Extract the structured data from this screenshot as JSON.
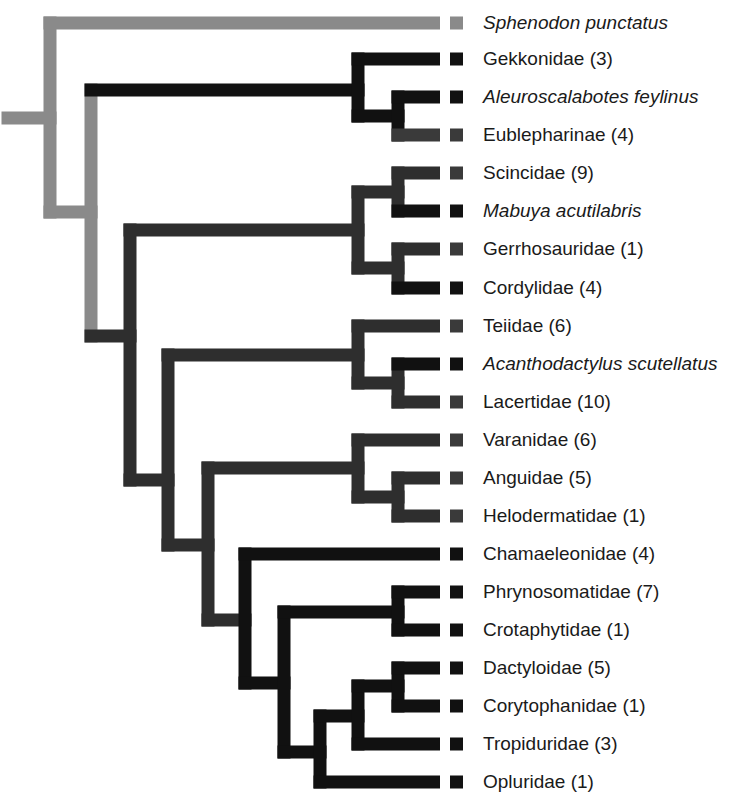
{
  "colors": {
    "outgroup": "#8a8a8a",
    "gekkota": "#111111",
    "squamata_dark": "#2e2e2e",
    "tip_black": "#111111",
    "tip_dark": "#3a3a3a",
    "tip_gray": "#8a8a8a",
    "background": "#ffffff"
  },
  "tips": [
    {
      "label": "Sphenodon punctatus",
      "italic": true,
      "y": 23,
      "color": "#8a8a8a"
    },
    {
      "label": "Gekkonidae (3)",
      "italic": false,
      "y": 59,
      "color": "#111111"
    },
    {
      "label": "Aleuroscalabotes feylinus",
      "italic": true,
      "y": 97,
      "color": "#111111"
    },
    {
      "label": "Eublepharinae (4)",
      "italic": false,
      "y": 135,
      "color": "#3a3a3a"
    },
    {
      "label": "Scincidae (9)",
      "italic": false,
      "y": 173,
      "color": "#3a3a3a"
    },
    {
      "label": "Mabuya acutilabris",
      "italic": true,
      "y": 211,
      "color": "#111111"
    },
    {
      "label": "Gerrhosauridae (1)",
      "italic": false,
      "y": 249,
      "color": "#3a3a3a"
    },
    {
      "label": "Cordylidae (4)",
      "italic": false,
      "y": 288,
      "color": "#111111"
    },
    {
      "label": "Teiidae (6)",
      "italic": false,
      "y": 326,
      "color": "#3a3a3a"
    },
    {
      "label": "Acanthodactylus scutellatus",
      "italic": true,
      "y": 364,
      "color": "#111111"
    },
    {
      "label": "Lacertidae (10)",
      "italic": false,
      "y": 402,
      "color": "#3a3a3a"
    },
    {
      "label": "Varanidae (6)",
      "italic": false,
      "y": 440,
      "color": "#3a3a3a"
    },
    {
      "label": "Anguidae (5)",
      "italic": false,
      "y": 478,
      "color": "#3a3a3a"
    },
    {
      "label": "Helodermatidae (1)",
      "italic": false,
      "y": 516,
      "color": "#3a3a3a"
    },
    {
      "label": "Chamaeleonidae (4)",
      "italic": false,
      "y": 554,
      "color": "#111111"
    },
    {
      "label": "Phrynosomatidae (7)",
      "italic": false,
      "y": 592,
      "color": "#111111"
    },
    {
      "label": "Crotaphytidae (1)",
      "italic": false,
      "y": 630,
      "color": "#111111"
    },
    {
      "label": "Dactyloidae (5)",
      "italic": false,
      "y": 668,
      "color": "#111111"
    },
    {
      "label": "Corytophanidae (1)",
      "italic": false,
      "y": 706,
      "color": "#111111"
    },
    {
      "label": "Tropiduridae (3)",
      "italic": false,
      "y": 744,
      "color": "#111111"
    },
    {
      "label": "Opluridae (1)",
      "italic": false,
      "y": 782,
      "color": "#111111"
    }
  ],
  "branch_end_x": 440,
  "square": {
    "x": 450,
    "size": 13
  },
  "segments": [
    {
      "c": "#8a8a8a",
      "x1": 8,
      "y1": 118,
      "x2": 50,
      "y2": 118
    },
    {
      "c": "#8a8a8a",
      "x1": 50,
      "y1": 23,
      "x2": 50,
      "y2": 212
    },
    {
      "c": "#8a8a8a",
      "x1": 50,
      "y1": 23,
      "x2": 440,
      "y2": 23
    },
    {
      "c": "#8a8a8a",
      "x1": 50,
      "y1": 212,
      "x2": 91,
      "y2": 212
    },
    {
      "c": "#8a8a8a",
      "x1": 91,
      "y1": 90,
      "x2": 91,
      "y2": 336
    },
    {
      "c": "#111111",
      "x1": 91,
      "y1": 90,
      "x2": 358,
      "y2": 90
    },
    {
      "c": "#111111",
      "x1": 358,
      "y1": 59,
      "x2": 358,
      "y2": 116
    },
    {
      "c": "#111111",
      "x1": 358,
      "y1": 59,
      "x2": 440,
      "y2": 59
    },
    {
      "c": "#111111",
      "x1": 358,
      "y1": 116,
      "x2": 398,
      "y2": 116
    },
    {
      "c": "#111111",
      "x1": 398,
      "y1": 97,
      "x2": 398,
      "y2": 135
    },
    {
      "c": "#111111",
      "x1": 398,
      "y1": 97,
      "x2": 440,
      "y2": 97
    },
    {
      "c": "#3a3a3a",
      "x1": 398,
      "y1": 135,
      "x2": 440,
      "y2": 135
    },
    {
      "c": "#2e2e2e",
      "x1": 91,
      "y1": 336,
      "x2": 130,
      "y2": 336
    },
    {
      "c": "#2e2e2e",
      "x1": 130,
      "y1": 230,
      "x2": 130,
      "y2": 480
    },
    {
      "c": "#2e2e2e",
      "x1": 130,
      "y1": 230,
      "x2": 358,
      "y2": 230
    },
    {
      "c": "#2e2e2e",
      "x1": 358,
      "y1": 192,
      "x2": 358,
      "y2": 268
    },
    {
      "c": "#2e2e2e",
      "x1": 358,
      "y1": 192,
      "x2": 398,
      "y2": 192
    },
    {
      "c": "#2e2e2e",
      "x1": 398,
      "y1": 173,
      "x2": 398,
      "y2": 211
    },
    {
      "c": "#2e2e2e",
      "x1": 398,
      "y1": 173,
      "x2": 440,
      "y2": 173
    },
    {
      "c": "#111111",
      "x1": 398,
      "y1": 211,
      "x2": 440,
      "y2": 211
    },
    {
      "c": "#2e2e2e",
      "x1": 358,
      "y1": 268,
      "x2": 398,
      "y2": 268
    },
    {
      "c": "#2e2e2e",
      "x1": 398,
      "y1": 249,
      "x2": 398,
      "y2": 288
    },
    {
      "c": "#2e2e2e",
      "x1": 398,
      "y1": 249,
      "x2": 440,
      "y2": 249
    },
    {
      "c": "#111111",
      "x1": 398,
      "y1": 288,
      "x2": 440,
      "y2": 288
    },
    {
      "c": "#2e2e2e",
      "x1": 130,
      "y1": 480,
      "x2": 168,
      "y2": 480
    },
    {
      "c": "#2e2e2e",
      "x1": 168,
      "y1": 355,
      "x2": 168,
      "y2": 545
    },
    {
      "c": "#2e2e2e",
      "x1": 168,
      "y1": 355,
      "x2": 358,
      "y2": 355
    },
    {
      "c": "#2e2e2e",
      "x1": 358,
      "y1": 326,
      "x2": 358,
      "y2": 383
    },
    {
      "c": "#2e2e2e",
      "x1": 358,
      "y1": 326,
      "x2": 440,
      "y2": 326
    },
    {
      "c": "#2e2e2e",
      "x1": 358,
      "y1": 383,
      "x2": 398,
      "y2": 383
    },
    {
      "c": "#2e2e2e",
      "x1": 398,
      "y1": 364,
      "x2": 398,
      "y2": 402
    },
    {
      "c": "#111111",
      "x1": 398,
      "y1": 364,
      "x2": 440,
      "y2": 364
    },
    {
      "c": "#2e2e2e",
      "x1": 398,
      "y1": 402,
      "x2": 440,
      "y2": 402
    },
    {
      "c": "#2e2e2e",
      "x1": 168,
      "y1": 545,
      "x2": 208,
      "y2": 545
    },
    {
      "c": "#2e2e2e",
      "x1": 208,
      "y1": 468,
      "x2": 208,
      "y2": 620
    },
    {
      "c": "#2e2e2e",
      "x1": 208,
      "y1": 468,
      "x2": 358,
      "y2": 468
    },
    {
      "c": "#2e2e2e",
      "x1": 358,
      "y1": 440,
      "x2": 358,
      "y2": 497
    },
    {
      "c": "#2e2e2e",
      "x1": 358,
      "y1": 440,
      "x2": 440,
      "y2": 440
    },
    {
      "c": "#2e2e2e",
      "x1": 358,
      "y1": 497,
      "x2": 398,
      "y2": 497
    },
    {
      "c": "#2e2e2e",
      "x1": 398,
      "y1": 478,
      "x2": 398,
      "y2": 516
    },
    {
      "c": "#2e2e2e",
      "x1": 398,
      "y1": 478,
      "x2": 440,
      "y2": 478
    },
    {
      "c": "#2e2e2e",
      "x1": 398,
      "y1": 516,
      "x2": 440,
      "y2": 516
    },
    {
      "c": "#2e2e2e",
      "x1": 208,
      "y1": 620,
      "x2": 245,
      "y2": 620
    },
    {
      "c": "#111111",
      "x1": 245,
      "y1": 554,
      "x2": 245,
      "y2": 683
    },
    {
      "c": "#111111",
      "x1": 245,
      "y1": 554,
      "x2": 440,
      "y2": 554
    },
    {
      "c": "#111111",
      "x1": 245,
      "y1": 683,
      "x2": 284,
      "y2": 683
    },
    {
      "c": "#111111",
      "x1": 284,
      "y1": 612,
      "x2": 284,
      "y2": 752
    },
    {
      "c": "#111111",
      "x1": 284,
      "y1": 612,
      "x2": 398,
      "y2": 612
    },
    {
      "c": "#111111",
      "x1": 398,
      "y1": 592,
      "x2": 398,
      "y2": 630
    },
    {
      "c": "#111111",
      "x1": 398,
      "y1": 592,
      "x2": 440,
      "y2": 592
    },
    {
      "c": "#111111",
      "x1": 398,
      "y1": 630,
      "x2": 440,
      "y2": 630
    },
    {
      "c": "#111111",
      "x1": 284,
      "y1": 752,
      "x2": 320,
      "y2": 752
    },
    {
      "c": "#111111",
      "x1": 320,
      "y1": 716,
      "x2": 320,
      "y2": 782
    },
    {
      "c": "#111111",
      "x1": 320,
      "y1": 782,
      "x2": 440,
      "y2": 782
    },
    {
      "c": "#111111",
      "x1": 320,
      "y1": 716,
      "x2": 358,
      "y2": 716
    },
    {
      "c": "#111111",
      "x1": 358,
      "y1": 686,
      "x2": 358,
      "y2": 744
    },
    {
      "c": "#111111",
      "x1": 358,
      "y1": 744,
      "x2": 440,
      "y2": 744
    },
    {
      "c": "#111111",
      "x1": 358,
      "y1": 686,
      "x2": 398,
      "y2": 686
    },
    {
      "c": "#111111",
      "x1": 398,
      "y1": 668,
      "x2": 398,
      "y2": 706
    },
    {
      "c": "#111111",
      "x1": 398,
      "y1": 668,
      "x2": 440,
      "y2": 668
    },
    {
      "c": "#111111",
      "x1": 398,
      "y1": 706,
      "x2": 440,
      "y2": 706
    }
  ],
  "stroke_width": 13
}
